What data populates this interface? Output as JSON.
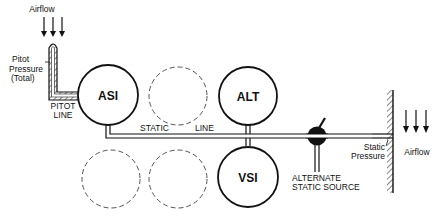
{
  "diagram": {
    "type": "pitot-static system schematic",
    "labels": {
      "airflow_top": "Airflow",
      "pitot_pressure_1": "Pitot",
      "pitot_pressure_2": "Pressure",
      "pitot_pressure_3": "(Total)",
      "pitot_line_1": "PITOT",
      "pitot_line_2": "LINE",
      "static_line_1": "STATIC",
      "static_line_2": "LINE",
      "alt_static_1": "ALTERNATE",
      "alt_static_2": "STATIC SOURCE",
      "static_pressure_1": "Static",
      "static_pressure_2": "Pressure",
      "airflow_right": "Airflow"
    },
    "instruments": [
      {
        "id": "asi",
        "label": "ASI"
      },
      {
        "id": "alt",
        "label": "ALT"
      },
      {
        "id": "vsi",
        "label": "VSI"
      }
    ],
    "placeholders": 3,
    "colors": {
      "line": "#111111",
      "dashed": "#555555",
      "background": "#ffffff"
    }
  }
}
